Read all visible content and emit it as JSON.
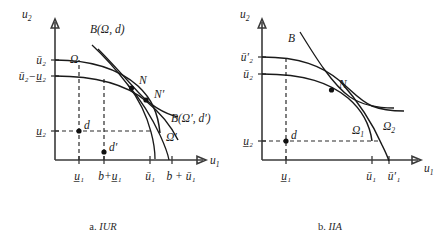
{
  "figure": {
    "title": "",
    "panels": [
      {
        "id": "panel-a",
        "caption_prefix": "a.",
        "caption_name": "IUR",
        "axis_y_label": "u",
        "axis_y_sub": "2",
        "axis_x_label": "u",
        "axis_x_sub": "1",
        "y_ticks": [
          {
            "id": "ybar2",
            "text": "ū",
            "sub": "2",
            "note": "upper bar u2"
          },
          {
            "id": "ybar2minus",
            "text": "ū",
            "sub": "2",
            "note": "ubar2 minus u-under-2"
          },
          {
            "id": "yunder2",
            "text": "u",
            "sub": "2",
            "note": "lower bar u2"
          }
        ],
        "y_tick_labels": [
          "ū₂",
          "ū₂−u̲₂",
          "u̲₂"
        ],
        "x_tick_labels": [
          "u̲₁",
          "b+u̲₁",
          "ū₁",
          "b + ū₁"
        ],
        "curve_labels": [
          {
            "id": "omega",
            "text": "Ω"
          },
          {
            "id": "omega-prime",
            "text": "Ω′"
          },
          {
            "id": "bargain-set",
            "text": "B(Ω, d)"
          },
          {
            "id": "bargain-set-prime",
            "text": "B(Ω′, d′)"
          }
        ],
        "point_labels": [
          {
            "id": "point-N",
            "text": "N"
          },
          {
            "id": "point-Nprime",
            "text": "N′"
          },
          {
            "id": "point-d",
            "text": "d"
          },
          {
            "id": "point-dprime",
            "text": "d′"
          }
        ]
      },
      {
        "id": "panel-b",
        "caption_prefix": "b.",
        "caption_name": "IIA",
        "axis_y_label": "u",
        "axis_y_sub": "2",
        "axis_x_label": "u",
        "axis_x_sub": "1",
        "y_tick_labels": [
          "ū′₂",
          "ū₂",
          "u̲₂"
        ],
        "x_tick_labels": [
          "u̲₁",
          "ū₁",
          "ū′₁"
        ],
        "curve_labels": [
          {
            "id": "bargain-set",
            "text": "B"
          },
          {
            "id": "omega-1",
            "text": "Ω"
          },
          {
            "id": "omega-1-sub",
            "text": "1"
          },
          {
            "id": "omega-2",
            "text": "Ω"
          },
          {
            "id": "omega-2-sub",
            "text": "2"
          }
        ],
        "point_labels": [
          {
            "id": "point-N",
            "text": "N"
          },
          {
            "id": "point-d",
            "text": "d"
          }
        ]
      }
    ],
    "colors": {
      "ink": "#1a1a1a",
      "axis": "#3a3a3a",
      "background": "#ffffff"
    }
  }
}
